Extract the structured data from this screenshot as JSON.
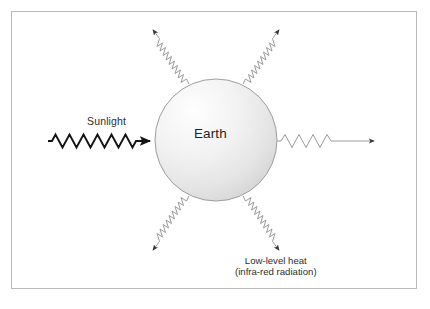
{
  "diagram": {
    "title_text": "Earth energy balance diagram",
    "background_color": "#ffffff",
    "frame_color": "#b9b9b9",
    "labels": {
      "sunlight": "Sunlight",
      "earth": "Earth",
      "heat_line1": "Low-level heat",
      "heat_line2": "(infra-red radiation)"
    },
    "earth": {
      "name": "Earth",
      "center_x": 216,
      "center_y": 140,
      "radius": 61,
      "fill_light": "#fdfdfd",
      "fill_dark": "#d8d8d8",
      "stroke_color": "#9a9a9a"
    },
    "incoming": {
      "name": "sunlight-wave-arrow",
      "label": "Sunlight",
      "color": "#1a1a1a",
      "stroke_width": 1.8,
      "start_x": 48,
      "end_x": 156,
      "y": 141,
      "cycles": 7,
      "amplitude": 6
    },
    "outgoing": [
      {
        "name": "infrared-wave-up-left",
        "angle_deg": 241,
        "color": "#9b9b9b",
        "arrow_color": "#3a3a3a"
      },
      {
        "name": "infrared-wave-up-right",
        "angle_deg": 299,
        "color": "#9b9b9b",
        "arrow_color": "#3a3a3a"
      },
      {
        "name": "infrared-wave-right",
        "angle_deg": 0,
        "color": "#9b9b9b",
        "arrow_color": "#3a3a3a"
      },
      {
        "name": "infrared-wave-down-left",
        "angle_deg": 119,
        "color": "#9b9b9b",
        "arrow_color": "#3a3a3a"
      },
      {
        "name": "infrared-wave-down-right",
        "angle_deg": 61,
        "color": "#9b9b9b",
        "arrow_color": "#3a3a3a"
      }
    ]
  }
}
